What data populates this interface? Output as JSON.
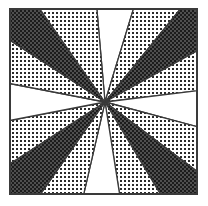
{
  "figure": {
    "type": "radial-wedge-diagram",
    "canvas": {
      "width": 208,
      "height": 206,
      "background": "#ffffff"
    },
    "frame": {
      "name": "square-border",
      "x": 10,
      "y": 9,
      "width": 187,
      "height": 185,
      "stroke": "#3a3a3a",
      "stroke_width": 2,
      "fill": "none"
    },
    "center": {
      "x": 105,
      "y": 102
    },
    "wedge_count": 16,
    "fills": {
      "dark": "#2b2b2b",
      "light": "#6e6e6e",
      "white": "#ffffff",
      "outline": "#3a3a3a"
    },
    "fill_legend": [
      {
        "key": "dark",
        "label": "dense cross-hatch",
        "color": "#2b2b2b"
      },
      {
        "key": "light",
        "label": "sparse dot grid",
        "color": "#6e6e6e"
      },
      {
        "key": "white",
        "label": "blank",
        "color": "#ffffff"
      }
    ],
    "wedges": [
      {
        "index": 0,
        "start_deg": -95,
        "end_deg": -73,
        "fill": "white"
      },
      {
        "index": 1,
        "start_deg": -73,
        "end_deg": -51,
        "fill": "light"
      },
      {
        "index": 2,
        "start_deg": -51,
        "end_deg": -29,
        "fill": "dark"
      },
      {
        "index": 3,
        "start_deg": -29,
        "end_deg": -7,
        "fill": "light"
      },
      {
        "index": 4,
        "start_deg": -7,
        "end_deg": 15,
        "fill": "white"
      },
      {
        "index": 5,
        "start_deg": 15,
        "end_deg": 37,
        "fill": "light"
      },
      {
        "index": 6,
        "start_deg": 37,
        "end_deg": 59,
        "fill": "dark"
      },
      {
        "index": 7,
        "start_deg": 59,
        "end_deg": 81,
        "fill": "light"
      },
      {
        "index": 8,
        "start_deg": 81,
        "end_deg": 103,
        "fill": "white"
      },
      {
        "index": 9,
        "start_deg": 103,
        "end_deg": 125,
        "fill": "light"
      },
      {
        "index": 10,
        "start_deg": 125,
        "end_deg": 147,
        "fill": "dark"
      },
      {
        "index": 11,
        "start_deg": 147,
        "end_deg": 169,
        "fill": "light"
      },
      {
        "index": 12,
        "start_deg": 169,
        "end_deg": 191,
        "fill": "white"
      },
      {
        "index": 13,
        "start_deg": 191,
        "end_deg": 213,
        "fill": "light"
      },
      {
        "index": 14,
        "start_deg": 213,
        "end_deg": 235,
        "fill": "dark"
      },
      {
        "index": 15,
        "start_deg": 235,
        "end_deg": 265,
        "fill": "light"
      }
    ]
  }
}
